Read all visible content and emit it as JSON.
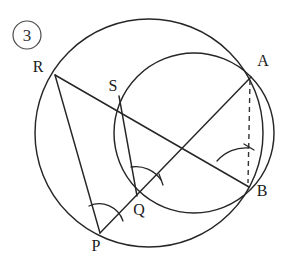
{
  "figure": {
    "number_badge": "3",
    "caption": "",
    "stroke_color": "#262626",
    "badge_color": "#4a4a4a",
    "background": "#ffffff"
  },
  "labels": {
    "badge": "3",
    "R": "R",
    "S": "S",
    "A": "A",
    "B": "B",
    "Q": "Q",
    "P": "P"
  },
  "geometry": {
    "circles": [
      {
        "name": "outer-circle",
        "cx": 149,
        "cy": 133,
        "r": 114
      },
      {
        "name": "inner-circle",
        "cx": 194,
        "cy": 133,
        "r": 80
      }
    ],
    "points": {
      "R": {
        "x": 55,
        "y": 75
      },
      "S": {
        "x": 119,
        "y": 96
      },
      "A": {
        "x": 250,
        "y": 76
      },
      "B": {
        "x": 248,
        "y": 186
      },
      "Q": {
        "x": 137,
        "y": 196
      },
      "P": {
        "x": 100,
        "y": 233
      }
    },
    "segments": [
      {
        "name": "segment-R-B",
        "from": "R",
        "to": "B"
      },
      {
        "name": "segment-R-P",
        "from": "R",
        "to": "P"
      },
      {
        "name": "segment-P-A",
        "from": "P",
        "to": "A"
      },
      {
        "name": "segment-S-Q",
        "from": "S",
        "to": "Q"
      },
      {
        "name": "segment-A-B",
        "from": "A",
        "to": "B"
      }
    ],
    "dashed_segments": [
      {
        "name": "dashed-segment-A-B",
        "from": "A",
        "to": "B"
      }
    ],
    "angle_marks": [
      {
        "name": "angle-mark-P",
        "vertex": "P",
        "ticks": 0
      },
      {
        "name": "angle-mark-Q",
        "vertex": "Q",
        "ticks": 1
      },
      {
        "name": "angle-mark-B",
        "vertex": "B",
        "ticks": 1
      }
    ]
  }
}
